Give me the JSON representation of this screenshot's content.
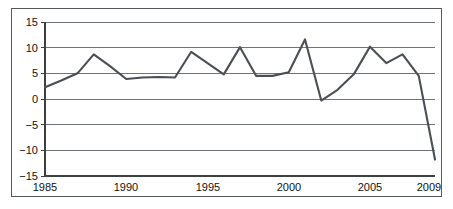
{
  "chart_data": {
    "type": "line",
    "title": "",
    "subtitle": "",
    "xlabel": "",
    "ylabel": "",
    "xlim": [
      1985,
      2009
    ],
    "ylim": [
      -15,
      15
    ],
    "grid": true,
    "legend": false,
    "legend_position": "none",
    "y_ticks": [
      15,
      10,
      5,
      0,
      -5,
      -10,
      -15
    ],
    "y_tick_labels": [
      "15",
      "10",
      "5",
      "0",
      "−5",
      "−10",
      "−15"
    ],
    "x_ticks": [
      1985,
      1990,
      1995,
      2000,
      2005,
      2009
    ],
    "x_tick_labels": [
      "1985",
      "1990",
      "1995",
      "2000",
      "2005",
      "2009"
    ],
    "series": [
      {
        "name": "series-1",
        "color": "#4a4f55",
        "x": [
          1985,
          1986,
          1987,
          1988,
          1989,
          1990,
          1991,
          1992,
          1993,
          1994,
          1995,
          1996,
          1997,
          1998,
          1999,
          2000,
          2001,
          2002,
          2003,
          2004,
          2005,
          2006,
          2007,
          2008,
          2009
        ],
        "values": [
          2.3,
          3.6,
          5.0,
          8.7,
          6.4,
          3.9,
          4.2,
          4.3,
          4.2,
          9.2,
          7.0,
          4.8,
          10.1,
          4.5,
          4.5,
          5.2,
          11.6,
          -0.3,
          1.8,
          4.8,
          10.2,
          7.0,
          8.7,
          4.5,
          -11.8
        ]
      }
    ]
  },
  "colors": {
    "line": "#4a4f55",
    "grid": "#6f7479",
    "axis": "#3c4043",
    "border": "#555a5e",
    "background": "#ffffff",
    "text": "#111111"
  }
}
